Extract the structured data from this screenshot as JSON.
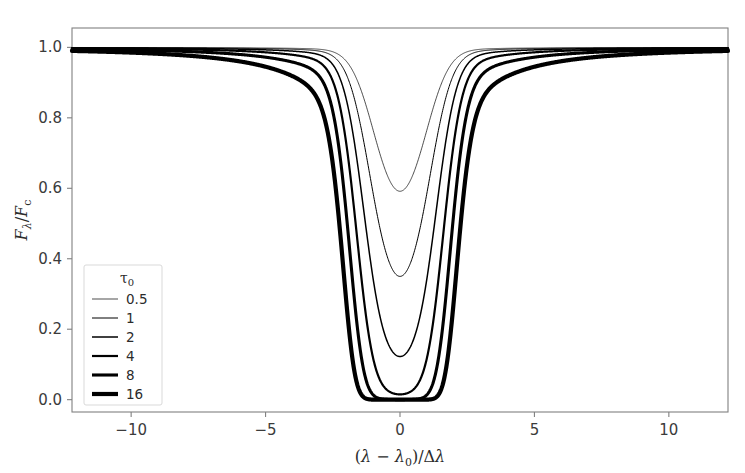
{
  "chart_data": {
    "type": "line",
    "title": "",
    "subtitle": "",
    "xlabel": "(λ − λ₀)/Δλ",
    "ylabel": "Fλ/Fc",
    "xlabel_parts": {
      "open": "(",
      "lambda": "λ",
      "minus": "−",
      "lambda0_base": "λ",
      "lambda0_sub": "0",
      "close": ")",
      "slash": "/",
      "delta": "Δ",
      "lambda2": "λ"
    },
    "ylabel_parts": {
      "F1": "F",
      "sub1": "λ",
      "slash": "/",
      "F2": "F",
      "sub2": "c"
    },
    "xlim": [
      -12.2,
      12.2
    ],
    "ylim": [
      -0.035,
      1.055
    ],
    "xticks": [
      -10,
      -5,
      0,
      5,
      10
    ],
    "xticklabels": [
      "−10",
      "−5",
      "0",
      "5",
      "10"
    ],
    "yticks": [
      0.0,
      0.2,
      0.4,
      0.6,
      0.8,
      1.0
    ],
    "yticklabels": [
      "0.0",
      "0.2",
      "0.4",
      "0.6",
      "0.8",
      "1.0"
    ],
    "grid": false,
    "legend_position": "lower left",
    "legend_title": "τ₀",
    "legend_title_parts": {
      "tau": "τ",
      "sub": "0"
    },
    "line_color": "#000000",
    "series": [
      {
        "name": "0.5",
        "tau0": 0.5,
        "linewidth": 0.7,
        "min_value": 0.72,
        "continuum": 1.0
      },
      {
        "name": "1",
        "tau0": 1,
        "linewidth": 1.0,
        "min_value": 0.51,
        "continuum": 1.0
      },
      {
        "name": "2",
        "tau0": 2,
        "linewidth": 1.5,
        "min_value": 0.26,
        "continuum": 1.0
      },
      {
        "name": "4",
        "tau0": 4,
        "linewidth": 2.2,
        "min_value": 0.08,
        "continuum": 1.0
      },
      {
        "name": "8",
        "tau0": 8,
        "linewidth": 3.1,
        "min_value": 0.018,
        "continuum": 1.0
      },
      {
        "name": "16",
        "tau0": 16,
        "linewidth": 4.2,
        "min_value": 0.005,
        "continuum": 1.0
      }
    ],
    "x_samples": [
      -12,
      -10,
      -8,
      -6,
      -5,
      -4,
      -3,
      -2.5,
      -2,
      -1.5,
      -1,
      -0.5,
      0,
      0.5,
      1,
      1.5,
      2,
      2.5,
      3,
      4,
      5,
      6,
      8,
      10,
      12
    ],
    "note_profile": "F/Fc = exp(-tau0 * phi(x)), phi = Voigt-like core with damping wings"
  },
  "legend": {
    "title": "τ₀",
    "entries": [
      {
        "label": "0.5"
      },
      {
        "label": "1"
      },
      {
        "label": "2"
      },
      {
        "label": "4"
      },
      {
        "label": "8"
      },
      {
        "label": "16"
      }
    ]
  },
  "axes": {
    "spine_color": "#808080",
    "tick_color": "#808080",
    "background": "#ffffff"
  }
}
